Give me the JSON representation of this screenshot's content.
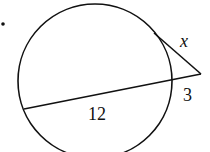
{
  "diagram": {
    "type": "circle-tangent-secant",
    "bullet": "•",
    "labels": {
      "tangent": "x",
      "external_secant": "3",
      "internal_chord": "12"
    },
    "colors": {
      "stroke": "#111111",
      "background": "#ffffff"
    }
  }
}
